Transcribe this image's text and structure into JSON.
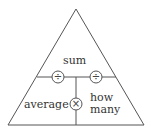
{
  "diagram": {
    "type": "formula-triangle",
    "top_label": "sum",
    "bottom_left_label": "average",
    "bottom_right_label_line1": "how",
    "bottom_right_label_line2": "many",
    "operators": {
      "left_divide": "÷",
      "right_divide": "÷",
      "multiply": "×"
    },
    "colors": {
      "line": "#555555",
      "text": "#333333",
      "background": "#ffffff"
    }
  }
}
